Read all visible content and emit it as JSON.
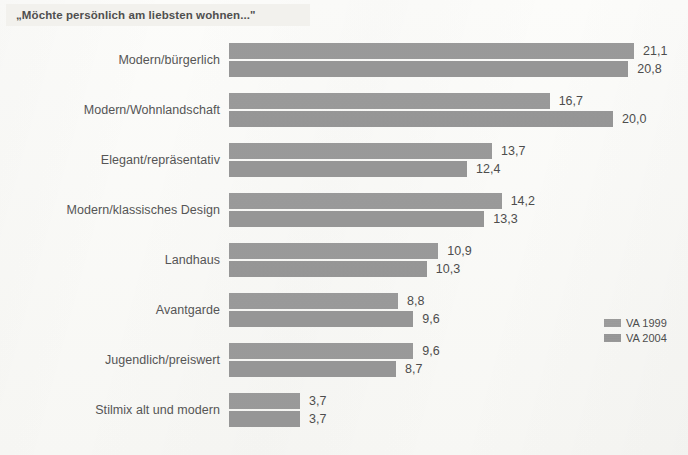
{
  "title": "„Möchte persönlich am liebsten wohnen...\"",
  "legend": {
    "entries": [
      {
        "label": "VA 1999",
        "color": "#9a9a9a"
      },
      {
        "label": "VA 2004",
        "color": "#979797"
      }
    ]
  },
  "chart_data": {
    "type": "bar",
    "orientation": "horizontal",
    "title": "„Möchte persönlich am liebsten wohnen...\"",
    "xlabel": "",
    "ylabel": "",
    "grid": false,
    "legend_position": "right-middle",
    "axis_visible": false,
    "value_decimal_separator": ",",
    "xlim": [
      0,
      21.1
    ],
    "categories": [
      "Modern/bürgerlich",
      "Modern/Wohnlandschaft",
      "Elegant/repräsentativ",
      "Modern/klassisches Design",
      "Landhaus",
      "Avantgarde",
      "Jugendlich/preiswert",
      "Stilmix alt und modern"
    ],
    "series": [
      {
        "name": "VA 1999",
        "color": "#9a9a9a",
        "values": [
          21.1,
          16.7,
          13.7,
          14.2,
          10.9,
          8.8,
          9.6,
          3.7
        ],
        "labels": [
          "21,1",
          "16,7",
          "13,7",
          "14,2",
          "10,9",
          "8,8",
          "9,6",
          "3,7"
        ]
      },
      {
        "name": "VA 2004",
        "color": "#979797",
        "values": [
          20.8,
          20.0,
          12.4,
          13.3,
          10.3,
          9.6,
          8.7,
          3.7
        ],
        "labels": [
          "20,8",
          "20,0",
          "12,4",
          "13,3",
          "10,3",
          "9,6",
          "8,7",
          "3,7"
        ]
      }
    ]
  }
}
